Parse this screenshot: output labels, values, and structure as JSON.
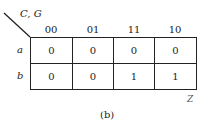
{
  "kmap": {
    "column_variables": "C, G",
    "row_variable_label": "",
    "columns": [
      "00",
      "01",
      "11",
      "10"
    ],
    "rows": [
      {
        "label": "a",
        "values": [
          "0",
          "0",
          "0",
          "0"
        ]
      },
      {
        "label": "b",
        "values": [
          "0",
          "0",
          "1",
          "1"
        ]
      }
    ],
    "output_label": "Z",
    "caption": "(b)"
  }
}
